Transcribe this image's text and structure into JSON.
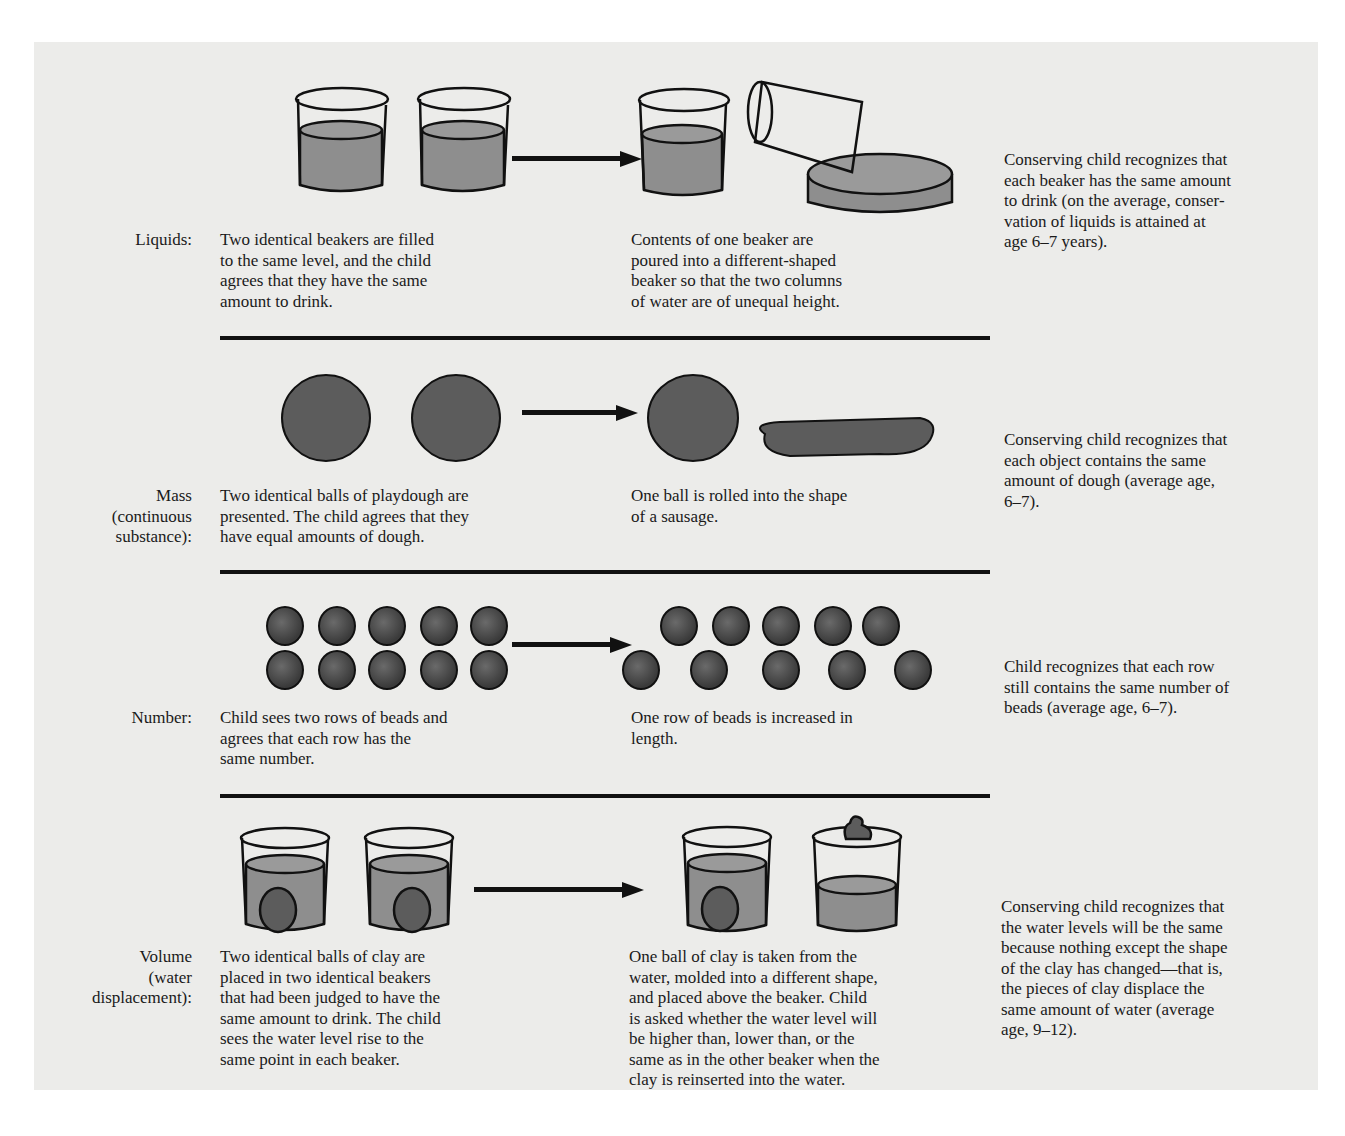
{
  "rows": [
    {
      "label": "Liquids:",
      "before": "Two identical beakers are filled to the same level, and the child agrees that they have the same amount to drink.",
      "after": "Contents of one beaker are poured into a different-shaped beaker so that the two columns of water are of unequal height.",
      "result": "Conserving child recognizes that each beaker has the same amount to drink (on the average, conservation of liquids is attained at age 6–7 years).",
      "before_lines": [
        "Two identical beakers are filled",
        "to the same level, and the child",
        "agrees that they have the same",
        "amount to drink."
      ],
      "after_lines": [
        "Contents of one beaker are",
        "poured into a different-shaped",
        "beaker so that the two columns",
        "of water are of unequal height."
      ],
      "result_lines": [
        "Conserving child recognizes that",
        "each beaker has the same amount",
        "to drink (on the average, conser-",
        "vation of liquids is attained at",
        "age 6–7 years)."
      ],
      "label_lines": [
        "Liquids:"
      ]
    },
    {
      "label": "Mass (continuous substance):",
      "label_lines": [
        "Mass",
        "(continuous",
        "substance):"
      ],
      "before_lines": [
        "Two identical balls of playdough are",
        "presented. The child agrees that they",
        "have equal amounts of dough."
      ],
      "after_lines": [
        "One ball is rolled into the shape",
        "of a sausage."
      ],
      "result_lines": [
        "Conserving child recognizes that",
        "each object contains the same",
        "amount of dough (average age,",
        "6–7)."
      ]
    },
    {
      "label": "Number:",
      "label_lines": [
        "Number:"
      ],
      "before_lines": [
        "Child sees two rows of beads and",
        "agrees that each row has the",
        "same number."
      ],
      "after_lines": [
        "One row of beads is increased in",
        "length."
      ],
      "result_lines": [
        "Child recognizes that each row",
        "still contains the same number of",
        "beads (average age, 6–7)."
      ]
    },
    {
      "label": "Volume (water displacement):",
      "label_lines": [
        "Volume",
        "(water",
        "displacement):"
      ],
      "before_lines": [
        "Two identical balls of clay are",
        "placed in two identical beakers",
        "that had been judged to have the",
        "same amount to drink. The child",
        "sees the water level rise to the",
        "same point in each beaker."
      ],
      "after_lines": [
        "One ball of clay is taken from the",
        "water, molded into a different shape,",
        "and placed above the beaker. Child",
        "is asked whether the water level will",
        "be higher than, lower than, or the",
        "same as in the other beaker when the",
        "clay is reinserted into the water."
      ],
      "result_lines": [
        "Conserving child recognizes that",
        "the water levels will be the same",
        "because nothing except the shape",
        "of the clay has changed—that is,",
        "the pieces of clay displace the",
        "same amount of water (average",
        "age, 9–12)."
      ]
    }
  ],
  "colors": {
    "page": "#ececea",
    "ink": "#111111",
    "fill": "#8e8e8e",
    "dough": "#5c5c5c"
  }
}
